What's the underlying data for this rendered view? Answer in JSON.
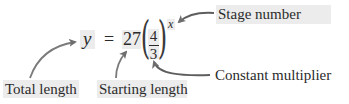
{
  "equation": {
    "lhs": "y",
    "equals": "=",
    "coefficient": "27",
    "fraction": {
      "numerator": "4",
      "denominator": "3"
    },
    "exponent": "x"
  },
  "annotations": {
    "stage_number": "Stage number",
    "total_length": "Total length",
    "starting_length": "Starting length",
    "constant_multiplier": "Constant multiplier"
  },
  "colors": {
    "highlight": "#ececec",
    "arrow": "#6e6e6e",
    "text": "#2b2b2b"
  }
}
